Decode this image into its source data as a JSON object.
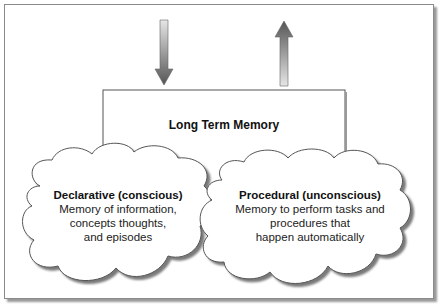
{
  "diagram": {
    "container": {
      "title": "Long Term Memory"
    },
    "arrows": [
      {
        "direction": "down",
        "meaning": "input-into-memory"
      },
      {
        "direction": "up",
        "meaning": "output-from-memory"
      }
    ],
    "clouds": [
      {
        "heading": "Declarative (conscious)",
        "lines": [
          "Memory of information,",
          "concepts thoughts,",
          "and episodes"
        ]
      },
      {
        "heading": "Procedural (unconscious)",
        "lines": [
          "Memory to perform tasks and",
          "procedures that",
          "happen automatically"
        ]
      }
    ],
    "colors": {
      "arrow_dark": "#555555",
      "arrow_light": "#e0e0e0",
      "line": "#555555",
      "shadow": "#8a8a8a",
      "background": "#ffffff"
    }
  }
}
